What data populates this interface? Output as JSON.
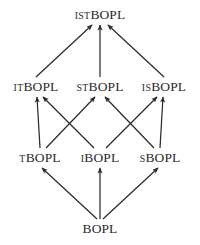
{
  "diagram": {
    "kind": "hasse-lattice",
    "background_color": "#ffffff",
    "ink_color": "#2b2b2b",
    "nodes": [
      {
        "id": "istbopl",
        "prefix": "IST",
        "stem": "BOPL",
        "text": "ISTBOPL",
        "x": 100,
        "y": 15,
        "rank": 3
      },
      {
        "id": "itbopl",
        "prefix": "IT",
        "stem": "BOPL",
        "text": "ITBOPL",
        "x": 36,
        "y": 87,
        "rank": 2
      },
      {
        "id": "stbopl",
        "prefix": "ST",
        "stem": "BOPL",
        "text": "STBOPL",
        "x": 100,
        "y": 87,
        "rank": 2
      },
      {
        "id": "isbopl",
        "prefix": "IS",
        "stem": "BOPL",
        "text": "ISBOPL",
        "x": 164,
        "y": 87,
        "rank": 2
      },
      {
        "id": "tbopl",
        "prefix": "T",
        "stem": "BOPL",
        "text": "TBOPL",
        "x": 40,
        "y": 158,
        "rank": 1
      },
      {
        "id": "ibopl",
        "prefix": "I",
        "stem": "BOPL",
        "text": "IBOPL",
        "x": 100,
        "y": 158,
        "rank": 1
      },
      {
        "id": "sbopl",
        "prefix": "S",
        "stem": "BOPL",
        "text": "SBOPL",
        "x": 160,
        "y": 158,
        "rank": 1
      },
      {
        "id": "bopl",
        "prefix": "",
        "stem": "BOPL",
        "text": "BOPL",
        "x": 100,
        "y": 229,
        "rank": 0
      }
    ],
    "edges": [
      {
        "from": "itbopl",
        "to": "istbopl",
        "x1": 36,
        "y1": 77,
        "x2": 92,
        "y2": 25
      },
      {
        "from": "stbopl",
        "to": "istbopl",
        "x1": 100,
        "y1": 77,
        "x2": 100,
        "y2": 25
      },
      {
        "from": "isbopl",
        "to": "istbopl",
        "x1": 164,
        "y1": 77,
        "x2": 108,
        "y2": 25
      },
      {
        "from": "tbopl",
        "to": "itbopl",
        "x1": 40,
        "y1": 148,
        "x2": 37,
        "y2": 97
      },
      {
        "from": "ibopl",
        "to": "itbopl",
        "x1": 94,
        "y1": 148,
        "x2": 43,
        "y2": 97
      },
      {
        "from": "tbopl",
        "to": "stbopl",
        "x1": 46,
        "y1": 148,
        "x2": 95,
        "y2": 97
      },
      {
        "from": "sbopl",
        "to": "stbopl",
        "x1": 154,
        "y1": 148,
        "x2": 105,
        "y2": 97
      },
      {
        "from": "ibopl",
        "to": "isbopl",
        "x1": 106,
        "y1": 148,
        "x2": 157,
        "y2": 97
      },
      {
        "from": "sbopl",
        "to": "isbopl",
        "x1": 160,
        "y1": 148,
        "x2": 163,
        "y2": 97
      },
      {
        "from": "bopl",
        "to": "tbopl",
        "x1": 97,
        "y1": 219,
        "x2": 42,
        "y2": 168
      },
      {
        "from": "bopl",
        "to": "ibopl",
        "x1": 100,
        "y1": 219,
        "x2": 100,
        "y2": 168
      },
      {
        "from": "bopl",
        "to": "sbopl",
        "x1": 103,
        "y1": 219,
        "x2": 158,
        "y2": 168
      }
    ]
  }
}
